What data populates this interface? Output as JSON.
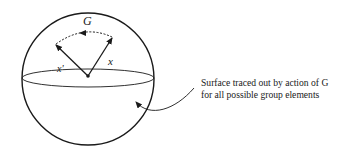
{
  "diagram": {
    "group_label": "G",
    "vector_x_label": "x",
    "vector_x_prime_label": "x'",
    "caption": {
      "line1": "Surface traced out by action of G",
      "line2": "for all possible group elements"
    },
    "colors": {
      "stroke": "#1a1a1a",
      "background": "#ffffff"
    }
  }
}
